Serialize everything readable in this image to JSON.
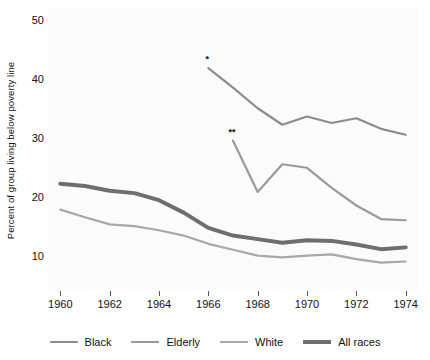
{
  "chart_data": {
    "type": "line",
    "title": "",
    "xlabel": "",
    "ylabel": "Percent of group living below poverty line",
    "xlim": [
      1959.5,
      1974.5
    ],
    "ylim": [
      4.0,
      52.0
    ],
    "grid": false,
    "legend_position": "bottom",
    "x_ticks": [
      1960,
      1962,
      1964,
      1966,
      1968,
      1970,
      1972,
      1974
    ],
    "y_ticks": [
      10,
      20,
      30,
      40,
      50
    ],
    "annotations": [
      {
        "text": "*",
        "series": "Black",
        "x": 1966,
        "y": 41.8
      },
      {
        "text": "**",
        "series": "Elderly",
        "x": 1967,
        "y": 29.5
      }
    ],
    "series": [
      {
        "name": "Black",
        "color": "#8c8c8c",
        "width": 2.2,
        "x": [
          1966,
          1967,
          1968,
          1969,
          1970,
          1971,
          1972,
          1973,
          1974
        ],
        "values": [
          41.8,
          38.5,
          35.0,
          32.2,
          33.6,
          32.5,
          33.3,
          31.5,
          30.5
        ]
      },
      {
        "name": "Elderly",
        "color": "#9a9a9a",
        "width": 2.2,
        "x": [
          1967,
          1968,
          1969,
          1970,
          1971,
          1972,
          1973,
          1974
        ],
        "values": [
          29.5,
          20.8,
          25.5,
          24.9,
          21.5,
          18.5,
          16.2,
          16.0
        ]
      },
      {
        "name": "White",
        "color": "#a8a8a8",
        "width": 2.2,
        "x": [
          1960,
          1961,
          1962,
          1963,
          1964,
          1965,
          1966,
          1967,
          1968,
          1969,
          1970,
          1971,
          1972,
          1973,
          1974
        ],
        "values": [
          17.8,
          16.5,
          15.3,
          15.0,
          14.3,
          13.4,
          12.0,
          11.0,
          10.0,
          9.7,
          10.0,
          10.2,
          9.4,
          8.8,
          9.0
        ]
      },
      {
        "name": "All races",
        "color": "#6e6e6e",
        "width": 4.0,
        "x": [
          1960,
          1961,
          1962,
          1963,
          1964,
          1965,
          1966,
          1967,
          1968,
          1969,
          1970,
          1971,
          1972,
          1973,
          1974
        ],
        "values": [
          22.2,
          21.8,
          21.0,
          20.6,
          19.4,
          17.3,
          14.7,
          13.4,
          12.8,
          12.2,
          12.6,
          12.5,
          11.9,
          11.1,
          11.4
        ]
      }
    ]
  },
  "legend": {
    "items": [
      {
        "label": "Black",
        "color": "#8c8c8c",
        "thickness": 2
      },
      {
        "label": "Elderly",
        "color": "#9a9a9a",
        "thickness": 2
      },
      {
        "label": "White",
        "color": "#a8a8a8",
        "thickness": 2
      },
      {
        "label": "All races",
        "color": "#6e6e6e",
        "thickness": 4
      }
    ]
  },
  "axes": {
    "y_title": "Percent of group living below poverty line",
    "y_tick_labels": [
      "10",
      "20",
      "30",
      "40",
      "50"
    ],
    "x_tick_labels": [
      "1960",
      "1962",
      "1964",
      "1966",
      "1968",
      "1970",
      "1972",
      "1974"
    ]
  }
}
